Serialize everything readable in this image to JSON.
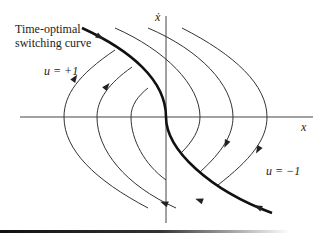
{
  "title_label": {
    "line1": "Time-optimal",
    "line2": "switching curve"
  },
  "labels": {
    "u_plus": "u = +1",
    "u_minus": "u = −1",
    "x_axis": "x",
    "y_axis": "ẋ"
  },
  "colors": {
    "curve": "#333333",
    "switching_curve": "#111111",
    "axis": "#444444"
  },
  "axes": {
    "origin": [
      166,
      117
    ],
    "x_range_px": [
      20,
      313
    ],
    "y_range_px": [
      16,
      223
    ]
  },
  "switching_curve": {
    "path": "M 82 28 C 130 50, 166 80, 166 117 C 166 150, 210 190, 272 213",
    "arrows": [
      [
        100,
        37,
        30
      ],
      [
        258,
        207,
        205
      ]
    ]
  },
  "trajectories_u_plus": [
    {
      "path": "M 148 208 C 95 180, 64 150, 64 117 C 64 95, 78 75, 115 50",
      "arrow": [
        75,
        78,
        -55
      ]
    },
    {
      "path": "M 176 208 C 125 185, 97 150, 97 117 C 97 100, 108 84, 132 67",
      "arrow": [
        107,
        86,
        -50
      ]
    },
    {
      "path": "M 166 180 C 145 165, 131 140, 131 117 C 131 105, 138 96, 148 88",
      "arrow": null
    }
  ],
  "trajectories_u_minus": [
    {
      "path": "M 182 28 C 235 55, 267 85, 267 117 C 267 140, 250 160, 218 185",
      "arrow": [
        258,
        150,
        120
      ]
    },
    {
      "path": "M 148 28 C 200 50, 233 85, 233 117 C 233 135, 222 152, 200 172",
      "arrow": [
        226,
        144,
        115
      ]
    },
    {
      "path": "M 115 28 C 165 50, 200 85, 200 117 C 200 130, 192 142, 182 152",
      "arrow": null
    }
  ],
  "lower_left_arrows": [
    {
      "path": "M 40 168 C 90 190, 120 200, 148 208",
      "arrow": [
        199,
        200,
        200
      ]
    },
    {
      "path": "M 70 165 C 100 185, 140 200, 176 208",
      "arrow": [
        164,
        203,
        200
      ]
    }
  ]
}
